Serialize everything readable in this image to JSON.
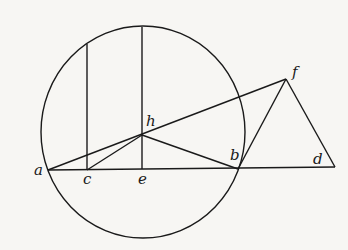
{
  "diagram": {
    "stroke_color": "#1a1a1a",
    "background": "#f7f6f3",
    "labels": {
      "a": "a",
      "c": "c",
      "e": "e",
      "h": "h",
      "b": "b",
      "d": "d",
      "f": "f"
    }
  }
}
